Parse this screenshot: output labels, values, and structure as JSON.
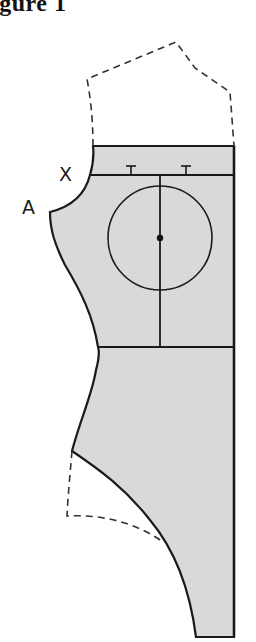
{
  "figure": {
    "title": "igure 1",
    "labels": {
      "x_point": "X",
      "a_point": "A"
    },
    "colors": {
      "fill": "#d9d9d9",
      "stroke": "#1a1a1a",
      "dashed": "#333333",
      "background": "#ffffff"
    },
    "parts": [
      "bodice-pattern-piece",
      "shoulder-extension-dashed",
      "chest-line",
      "waist-line",
      "center-front-line",
      "bust-circle",
      "bust-point",
      "dart-mark-left",
      "dart-mark-right",
      "leg-extension-dashed"
    ]
  }
}
